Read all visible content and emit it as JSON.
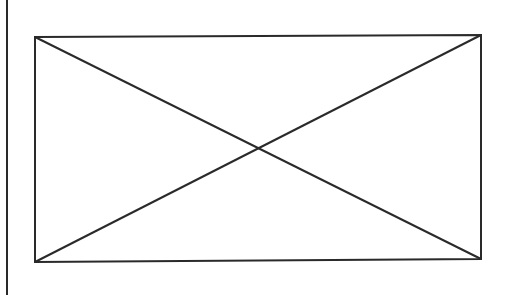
{
  "canvas": {
    "width": 505,
    "height": 295,
    "background": "#ffffff"
  },
  "left_rule": {
    "x": 7,
    "color": "#2a2a2a"
  },
  "placeholder": {
    "icon": "image-placeholder-icon",
    "stroke": "#2a2a2a",
    "stroke_width": 2,
    "corners": {
      "top_left": [
        35,
        37
      ],
      "top_right": [
        481,
        35
      ],
      "bottom_right": [
        481,
        259
      ],
      "bottom_left": [
        35,
        262
      ]
    },
    "center": [
      257,
      148
    ]
  }
}
